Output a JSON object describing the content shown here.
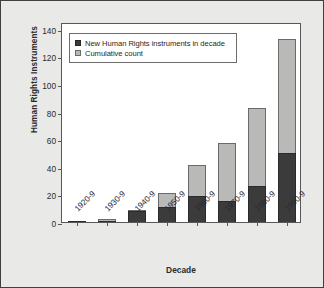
{
  "chart_data": {
    "type": "bar",
    "title": "",
    "subtitle": "",
    "xlabel": "Decade",
    "ylabel": "Human Rights Instruments",
    "categories": [
      "1920-9",
      "1930-9",
      "1940-9",
      "1950-9",
      "1960-9",
      "1970-9",
      "1980-9",
      "1990-9"
    ],
    "series": [
      {
        "name": "New Human Rights instruments in decade",
        "color": "#3b3b3b",
        "values": [
          1,
          1,
          8,
          11,
          19,
          15,
          26,
          50
        ]
      },
      {
        "name": "Cumulative count",
        "color": "#b9b9b7",
        "values": [
          0,
          1,
          1,
          10,
          22,
          42,
          57,
          83
        ]
      }
    ],
    "totals": [
      1,
      2,
      9,
      21,
      41,
      57,
      83,
      133
    ],
    "stacked": true,
    "ylim": [
      0,
      145
    ],
    "yticks": [
      0,
      20,
      40,
      60,
      80,
      100,
      120,
      140
    ],
    "ytick_labels": [
      "0",
      "20",
      "40",
      "60",
      "80",
      "100",
      "120",
      "140"
    ],
    "grid": false,
    "legend_position": "top-left",
    "legend_entries": [
      {
        "label": "New Human Rights instruments in decade",
        "swatch": "dark"
      },
      {
        "label": "Cumulative count",
        "swatch": "light"
      }
    ]
  },
  "colors": {
    "background": "#e9e9e7",
    "plot_background": "#ffffff",
    "frame": "#58585a",
    "series_dark": "#3b3b3b",
    "series_light": "#b9b9b7",
    "text": "#2b2b2b"
  }
}
